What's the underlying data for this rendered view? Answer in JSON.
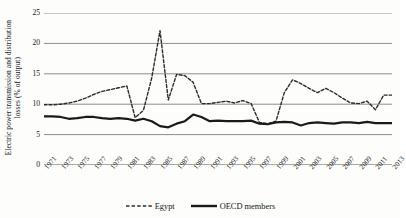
{
  "chart_data": {
    "type": "line",
    "title": "",
    "subtitle": "",
    "xlabel": "",
    "ylabel": "Electric power transmission and distribution losses (% of output)",
    "ylabel_line1": "Electric power transmission and distribution",
    "ylabel_line2": "losses (% of output)",
    "ylim": [
      0,
      25
    ],
    "y_ticks": [
      0,
      5,
      10,
      15,
      20,
      25
    ],
    "y_tick_labels": [
      "0",
      "5",
      "10",
      "15",
      "20",
      "25"
    ],
    "grid": true,
    "grid_axis": "y",
    "legend_position": "bottom",
    "x": [
      1971,
      1972,
      1973,
      1974,
      1975,
      1976,
      1977,
      1978,
      1979,
      1980,
      1981,
      1982,
      1983,
      1984,
      1985,
      1986,
      1987,
      1988,
      1989,
      1990,
      1991,
      1992,
      1993,
      1994,
      1995,
      1996,
      1997,
      1998,
      1999,
      2000,
      2001,
      2002,
      2003,
      2004,
      2005,
      2006,
      2007,
      2008,
      2009,
      2010,
      2011,
      2012,
      2013
    ],
    "x_tick_labels": [
      "1971",
      "1973",
      "1975",
      "1977",
      "1979",
      "1981",
      "1983",
      "1985",
      "1987",
      "1989",
      "1991",
      "1993",
      "1995",
      "1997",
      "1999",
      "2001",
      "2003",
      "2005",
      "2007",
      "2009",
      "2011",
      "2013"
    ],
    "xlim": [
      1971,
      2013
    ],
    "series": [
      {
        "name": "Egypt",
        "style": "dashed",
        "color": "#2b2b2b",
        "values": [
          9.9,
          9.9,
          10.0,
          10.2,
          10.5,
          11.0,
          11.6,
          12.1,
          12.4,
          12.7,
          13.0,
          7.8,
          9.0,
          14.3,
          22.1,
          10.7,
          14.9,
          14.7,
          13.6,
          10.1,
          10.1,
          10.3,
          10.5,
          10.2,
          10.6,
          10.1,
          7.0,
          6.8,
          7.2,
          11.9,
          14.0,
          13.4,
          12.6,
          11.9,
          12.6,
          11.9,
          11.0,
          10.2,
          10.1,
          10.5,
          9.1,
          11.5,
          11.5
        ]
      },
      {
        "name": "OECD members",
        "style": "solid",
        "color": "#1a1a1a",
        "values": [
          8.0,
          8.0,
          7.9,
          7.6,
          7.7,
          7.9,
          7.9,
          7.7,
          7.6,
          7.7,
          7.6,
          7.3,
          7.6,
          7.2,
          6.4,
          6.2,
          6.8,
          7.2,
          8.3,
          7.9,
          7.2,
          7.3,
          7.2,
          7.2,
          7.2,
          7.3,
          6.8,
          6.7,
          7.0,
          7.1,
          7.0,
          6.5,
          6.9,
          7.0,
          6.9,
          6.8,
          7.0,
          7.0,
          6.9,
          7.1,
          6.9,
          6.9,
          6.9
        ]
      }
    ]
  },
  "legend": {
    "items": [
      {
        "label": "Egypt",
        "style": "dashed"
      },
      {
        "label": "OECD members",
        "style": "solid"
      }
    ]
  }
}
